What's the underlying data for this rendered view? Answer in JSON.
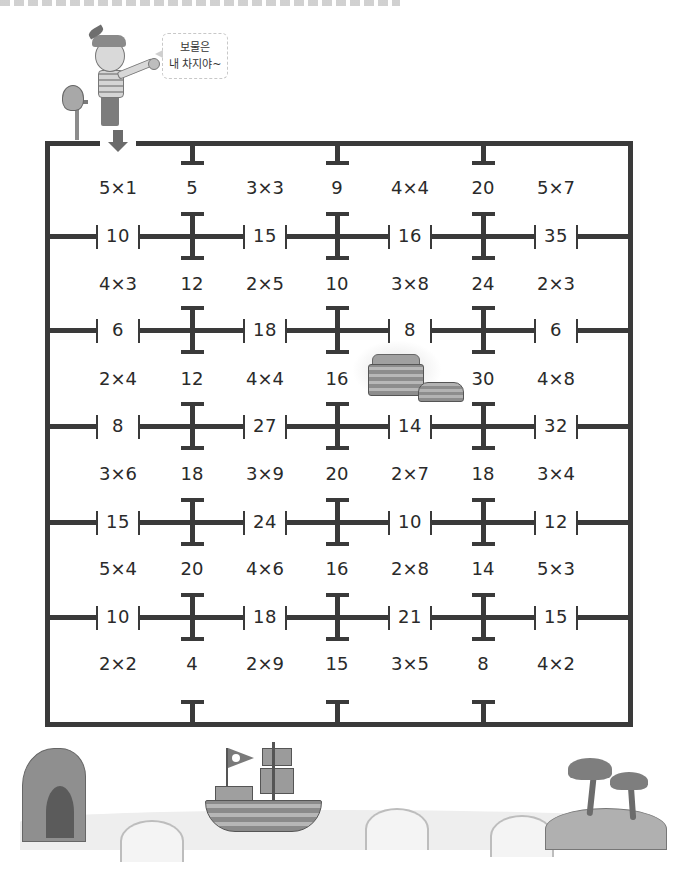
{
  "worksheet": {
    "header_strip": "",
    "speech_bubble": {
      "line1": "보물은",
      "line2": "내 차지야~"
    },
    "start_marker": "arrow-down",
    "goal": "treasure-chest"
  },
  "maze": {
    "rows": [
      {
        "cells": [
          "5×1",
          "5",
          "3×3",
          "9",
          "4×4",
          "20",
          "5×7"
        ],
        "gates": [
          "10",
          "15",
          "16",
          "35"
        ]
      },
      {
        "cells": [
          "4×3",
          "12",
          "2×5",
          "10",
          "3×8",
          "24",
          "2×3"
        ],
        "gates": [
          "6",
          "18",
          "8",
          "6"
        ]
      },
      {
        "cells": [
          "2×4",
          "12",
          "4×4",
          "16",
          "",
          "30",
          "4×8"
        ],
        "gates": [
          "8",
          "27",
          "14",
          "32"
        ]
      },
      {
        "cells": [
          "3×6",
          "18",
          "3×9",
          "20",
          "2×7",
          "18",
          "3×4"
        ],
        "gates": [
          "15",
          "24",
          "10",
          "12"
        ]
      },
      {
        "cells": [
          "5×4",
          "20",
          "4×6",
          "16",
          "2×8",
          "14",
          "5×3"
        ],
        "gates": [
          "10",
          "18",
          "21",
          "15"
        ]
      },
      {
        "cells": [
          "2×2",
          "4",
          "2×9",
          "15",
          "3×5",
          "8",
          "4×2"
        ],
        "gates": []
      }
    ]
  },
  "scenery": {
    "left": "rock-cave",
    "center": "pirate-ship",
    "right": "palm-island"
  }
}
